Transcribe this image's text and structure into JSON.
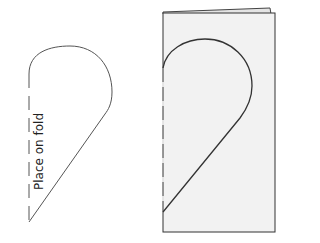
{
  "diagram": {
    "pattern_piece": {
      "fold_label": "Place on fold"
    },
    "folded_paper": {},
    "colors": {
      "stroke": "#444444",
      "paper_fill": "#f2f2f2",
      "paper_edge": "#333333"
    }
  }
}
